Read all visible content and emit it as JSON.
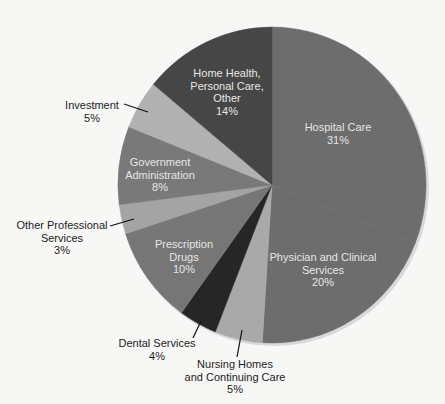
{
  "chart_data": {
    "type": "pie",
    "title": "",
    "start_angle_deg": 0,
    "direction": "clockwise",
    "colors": {
      "background": "#f7f7f6",
      "edge_shadow": "#d6d6d6"
    },
    "slices": [
      {
        "name": "Hospital Care",
        "value": 31,
        "label_lines": [
          "Hospital Care",
          "31%"
        ],
        "color": "#6d6d6d",
        "label_pos": "inside"
      },
      {
        "name": "Physician and Clinical Services",
        "value": 20,
        "label_lines": [
          "Physician and Clinical",
          "Services",
          "20%"
        ],
        "color": "#6d6d6d",
        "label_pos": "inside"
      },
      {
        "name": "Nursing Homes and Continuing Care",
        "value": 5,
        "label_lines": [
          "Nursing Homes",
          "and Continuing Care",
          "5%"
        ],
        "color": "#a9a9a9",
        "label_pos": "outside"
      },
      {
        "name": "Dental Services",
        "value": 4,
        "label_lines": [
          "Dental Services",
          "4%"
        ],
        "color": "#262626",
        "label_pos": "outside"
      },
      {
        "name": "Prescription Drugs",
        "value": 10,
        "label_lines": [
          "Prescription",
          "Drugs",
          "10%"
        ],
        "color": "#767676",
        "label_pos": "inside"
      },
      {
        "name": "Other Professional Services",
        "value": 3,
        "label_lines": [
          "Other Professional",
          "Services",
          "3%"
        ],
        "color": "#a4a4a4",
        "label_pos": "outside"
      },
      {
        "name": "Government Administration",
        "value": 8,
        "label_lines": [
          "Government",
          "Administration",
          "8%"
        ],
        "color": "#797979",
        "label_pos": "inside"
      },
      {
        "name": "Investment",
        "value": 5,
        "label_lines": [
          "Investment",
          "5%"
        ],
        "color": "#b1b1b1",
        "label_pos": "outside"
      },
      {
        "name": "Home Health, Personal Care, Other",
        "value": 14,
        "label_lines": [
          "Home Health,",
          "Personal Care,",
          "Other",
          "14%"
        ],
        "color": "#464646",
        "label_pos": "inside"
      }
    ]
  },
  "labels": {
    "hospital": {
      "l1": "Hospital Care",
      "l2": "31%"
    },
    "physician": {
      "l1": "Physician and Clinical",
      "l2": "Services",
      "l3": "20%"
    },
    "nursing": {
      "l1": "Nursing Homes",
      "l2": "and Continuing Care",
      "l3": "5%"
    },
    "dental": {
      "l1": "Dental Services",
      "l2": "4%"
    },
    "prescription": {
      "l1": "Prescription",
      "l2": "Drugs",
      "l3": "10%"
    },
    "other_prof": {
      "l1": "Other Professional",
      "l2": "Services",
      "l3": "3%"
    },
    "government": {
      "l1": "Government",
      "l2": "Administration",
      "l3": "8%"
    },
    "investment": {
      "l1": "Investment",
      "l2": "5%"
    },
    "home_health": {
      "l1": "Home Health,",
      "l2": "Personal Care,",
      "l3": "Other",
      "l4": "14%"
    }
  }
}
